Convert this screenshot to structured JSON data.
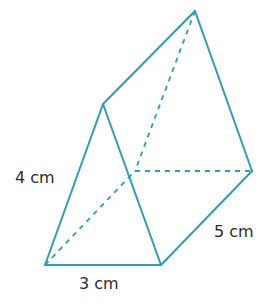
{
  "diagram": {
    "type": "triangular-prism",
    "line_color": "#2f9cb8",
    "vertices": {
      "front_bottom_left": [
        45,
        265
      ],
      "front_bottom_right": [
        161,
        265
      ],
      "front_apex": [
        103,
        104
      ],
      "back_bottom_left": [
        135,
        171
      ],
      "back_bottom_right": [
        252,
        171
      ],
      "back_apex": [
        195,
        11
      ]
    },
    "labels": {
      "front_side": "4 cm",
      "front_base": "3 cm",
      "length": "5 cm"
    }
  }
}
